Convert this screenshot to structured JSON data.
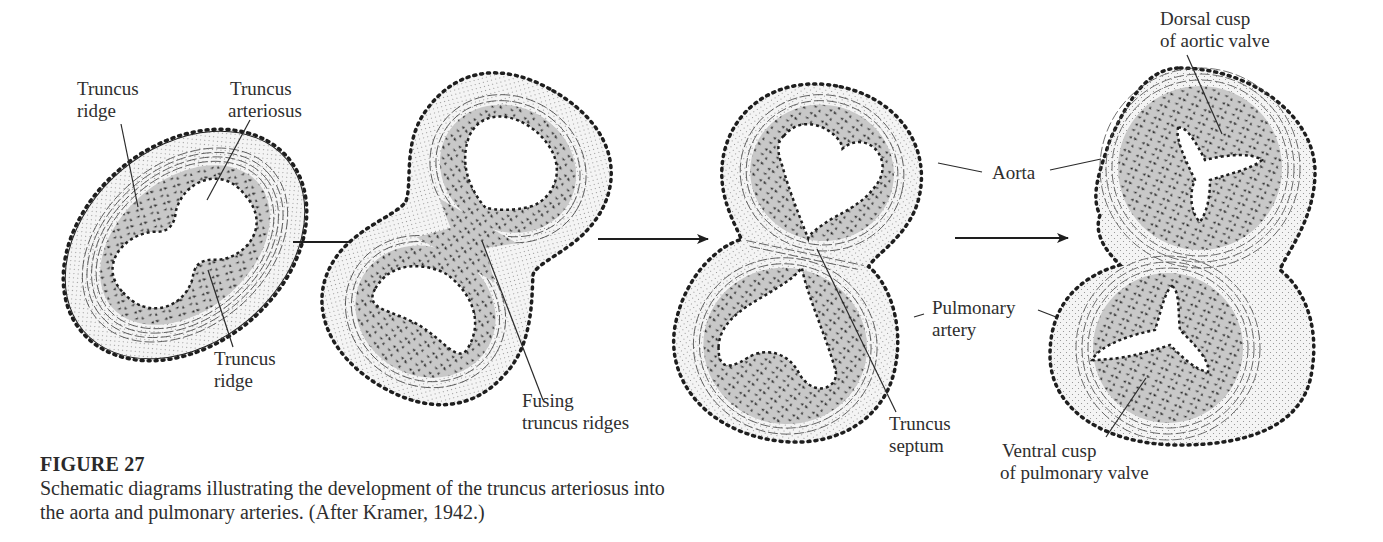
{
  "figure": {
    "number_label": "FIGURE 27",
    "caption_lines": [
      "Schematic diagrams illustrating the development of the truncus arteriosus into",
      "the aorta and pulmonary arteries. (After Kramer, 1942.)"
    ]
  },
  "stages": [
    {
      "id": "stage-1",
      "labels": [
        {
          "name": "truncus-ridge-upper",
          "lines": [
            "Truncus",
            "ridge"
          ]
        },
        {
          "name": "truncus-arteriosus",
          "lines": [
            "Truncus",
            "arteriosus"
          ]
        },
        {
          "name": "truncus-ridge-lower",
          "lines": [
            "Truncus",
            "ridge"
          ]
        }
      ]
    },
    {
      "id": "stage-2",
      "labels": [
        {
          "name": "fusing-truncus-ridges",
          "lines": [
            "Fusing",
            "truncus ridges"
          ]
        }
      ]
    },
    {
      "id": "stage-3",
      "labels": [
        {
          "name": "truncus-septum",
          "lines": [
            "Truncus",
            "septum"
          ]
        }
      ]
    },
    {
      "id": "stage-4",
      "labels": [
        {
          "name": "dorsal-cusp-aortic-valve",
          "lines": [
            "Dorsal cusp",
            "of aortic valve"
          ]
        },
        {
          "name": "ventral-cusp-pulmonary-valve",
          "lines": [
            "Ventral cusp",
            "of pulmonary valve"
          ]
        }
      ]
    }
  ],
  "shared_labels": {
    "aorta": "Aorta",
    "pulmonary_artery": [
      "Pulmonary",
      "artery"
    ]
  },
  "arrows": 3,
  "colors": {
    "ink": "#1e1e1e",
    "mesenchyme_fill": "#c8c8c8",
    "adventitia_fill": "#f2f2f2",
    "background": "#ffffff"
  }
}
